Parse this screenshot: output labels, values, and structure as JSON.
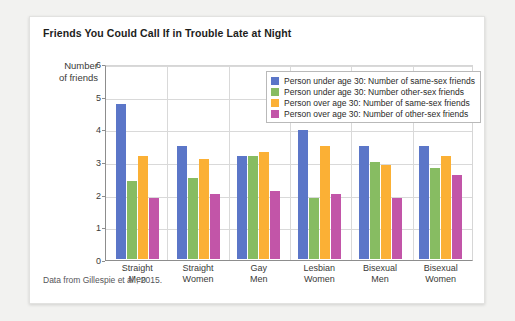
{
  "card": {
    "title": "Friends You Could Call If in Trouble Late at Night",
    "y_axis_label": "Number\nof friends",
    "y_axis_label_line1": "Number",
    "y_axis_label_line2": "of friends",
    "footer": "Data from Gillespie et al., 2015."
  },
  "chart_data": {
    "type": "bar",
    "title": "Friends You Could Call If in Trouble Late at Night",
    "xlabel": "",
    "ylabel": "Number of friends",
    "ylim": [
      0,
      6
    ],
    "yticks": [
      0,
      1,
      2,
      3,
      4,
      5,
      6
    ],
    "grid": true,
    "legend_position": "top-right-inside",
    "categories": [
      "Straight Men",
      "Straight Women",
      "Gay Men",
      "Lesbian Women",
      "Bisexual Men",
      "Bisexual Women"
    ],
    "category_lines": [
      [
        "Straight",
        "Men"
      ],
      [
        "Straight",
        "Women"
      ],
      [
        "Gay",
        "Men"
      ],
      [
        "Lesbian",
        "Women"
      ],
      [
        "Bisexual",
        "Men"
      ],
      [
        "Bisexual",
        "Women"
      ]
    ],
    "series": [
      {
        "name": "Person under age 30: Number of same-sex friends",
        "color": "#5b76c8",
        "values": [
          4.8,
          3.5,
          3.2,
          4.0,
          3.5,
          3.5
        ]
      },
      {
        "name": "Person under age 30: Number other-sex friends",
        "color": "#87bc62",
        "values": [
          2.4,
          2.5,
          3.2,
          1.9,
          3.0,
          2.8
        ]
      },
      {
        "name": "Person over age 30: Number of same-sex friends",
        "color": "#fbb035",
        "values": [
          3.2,
          3.1,
          3.3,
          3.5,
          2.9,
          3.2
        ]
      },
      {
        "name": "Person over age 30: Number of other-sex friends",
        "color": "#c255a8",
        "values": [
          1.9,
          2.0,
          2.1,
          2.0,
          1.9,
          2.6
        ]
      }
    ],
    "annotations": [
      "Data from Gillespie et al., 2015."
    ]
  }
}
